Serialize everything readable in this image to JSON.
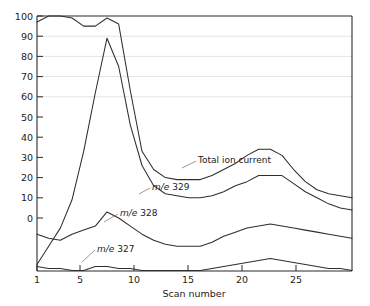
{
  "chart_data": {
    "type": "line",
    "title": "",
    "xlabel": "Scan number",
    "ylabel": "",
    "xlim": [
      1,
      28
    ],
    "ylim": [
      -26,
      100
    ],
    "grid": "horizontal-faint",
    "legend": "inline-annotations",
    "xticks": [
      1,
      5,
      10,
      15,
      20,
      25
    ],
    "xtick_labels": [
      "1",
      "5",
      "10",
      "15",
      "20",
      "25"
    ],
    "yticks": [
      0,
      10,
      20,
      30,
      40,
      50,
      60,
      70,
      80,
      90,
      100
    ],
    "ytick_labels": [
      "0",
      "10",
      "20",
      "30",
      "40",
      "50",
      "60",
      "70",
      "80",
      "90",
      "100"
    ],
    "x": [
      1,
      2,
      3,
      4,
      5,
      6,
      7,
      8,
      9,
      10,
      11,
      12,
      13,
      14,
      15,
      16,
      17,
      18,
      19,
      20,
      21,
      22,
      23,
      24,
      25,
      26,
      27,
      28
    ],
    "series": [
      {
        "name": "Total ion current",
        "label": "Total ion current",
        "values": [
          97,
          100,
          100,
          99,
          95,
          95,
          99,
          96,
          63,
          33,
          24,
          20,
          19,
          19,
          19,
          21,
          24,
          27,
          31,
          34,
          34,
          31,
          24,
          18,
          14,
          12,
          11,
          10
        ]
      },
      {
        "name": "m/e 329",
        "label_prefix": "m/e",
        "label_value": "329",
        "values": [
          -23,
          -14,
          -5,
          9,
          33,
          62,
          89,
          75,
          46,
          26,
          16,
          12,
          11,
          10,
          10,
          11,
          13,
          16,
          18,
          21,
          21,
          21,
          17,
          13,
          10,
          7,
          5,
          4
        ]
      },
      {
        "name": "m/e 328",
        "label_prefix": "m/e",
        "label_value": "328",
        "values": [
          -8,
          -10,
          -11,
          -8,
          -6,
          -4,
          3,
          0,
          -4,
          -8,
          -11,
          -13,
          -14,
          -14,
          -14,
          -12,
          -9,
          -7,
          -5,
          -4,
          -3,
          -4,
          -5,
          -6,
          -7,
          -8,
          -9,
          -10
        ]
      },
      {
        "name": "m/e 327",
        "label_prefix": "m/e",
        "label_value": "327",
        "values": [
          -24,
          -25,
          -25,
          -26,
          -26,
          -24,
          -24,
          -25,
          -25,
          -26,
          -26,
          -26,
          -26,
          -26,
          -26,
          -25,
          -24,
          -23,
          -22,
          -21,
          -20,
          -21,
          -22,
          -23,
          -24,
          -25,
          -25,
          -26
        ]
      }
    ],
    "annotations": [
      {
        "text": "Total ion current",
        "for": "Total ion current"
      },
      {
        "text": "m/e 329",
        "for": "m/e 329"
      },
      {
        "text": "m/e 328",
        "for": "m/e 328"
      },
      {
        "text": "m/e 327",
        "for": "m/e 327"
      }
    ]
  },
  "colors": {
    "curve": "#2e2e2e",
    "axis": "#2b2b2b",
    "grid": "#d8d8d8",
    "background": "#ffffff"
  }
}
